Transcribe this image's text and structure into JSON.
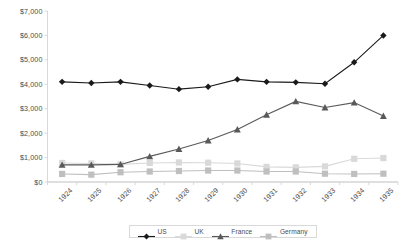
{
  "chart_data": {
    "type": "line",
    "title": "",
    "subtitle": "",
    "xlabel": "",
    "ylabel": "",
    "ylim": [
      0,
      7000
    ],
    "ytick_labels": [
      "$0",
      "$1,000",
      "$2,000",
      "$3,000",
      "$4,000",
      "$5,000",
      "$6,000",
      "$7,000"
    ],
    "ytick_values": [
      0,
      1000,
      2000,
      3000,
      4000,
      5000,
      6000,
      7000
    ],
    "grid": false,
    "legend_position": "bottom",
    "categories": [
      "1924",
      "1925",
      "1926",
      "1927",
      "1928",
      "1929",
      "1930",
      "1931",
      "1932",
      "1933",
      "1934",
      "1935"
    ],
    "series": [
      {
        "name": "US",
        "color": "#1a1a1a",
        "marker": "diamond",
        "line_style": "solid",
        "values": [
          4100,
          4050,
          4100,
          3950,
          3800,
          3900,
          4200,
          4100,
          4080,
          4020,
          4900,
          6000
        ]
      },
      {
        "name": "UK",
        "color": "#d9d9d9",
        "marker": "square",
        "line_style": "solid",
        "values": [
          780,
          760,
          720,
          780,
          800,
          790,
          760,
          620,
          600,
          640,
          950,
          980
        ]
      },
      {
        "name": "France",
        "color": "#595959",
        "marker": "triangle",
        "line_style": "solid",
        "values": [
          700,
          700,
          720,
          1050,
          1350,
          1700,
          2150,
          2750,
          3300,
          3050,
          3250,
          2700
        ]
      },
      {
        "name": "Germany",
        "color": "#bfbfbf",
        "marker": "square",
        "line_style": "solid",
        "values": [
          330,
          300,
          400,
          430,
          450,
          470,
          470,
          430,
          430,
          340,
          330,
          340
        ]
      }
    ]
  },
  "legend": {
    "items": [
      {
        "label": "US"
      },
      {
        "label": "UK"
      },
      {
        "label": "France"
      },
      {
        "label": "Germany"
      }
    ]
  },
  "axes": {
    "y_axis_name": "value-axis",
    "x_axis_name": "category-axis"
  }
}
